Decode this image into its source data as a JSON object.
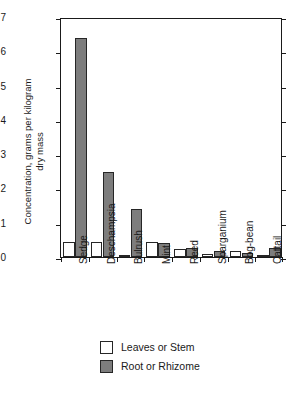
{
  "chart_data": {
    "type": "bar",
    "title": "",
    "xlabel": "",
    "ylabel": "Concentration, grams per kilogram\ndry mass",
    "ylim": [
      0,
      7
    ],
    "yticks": [
      0,
      1,
      2,
      3,
      4,
      5,
      6,
      7
    ],
    "ytick_labels": [
      "0",
      "1",
      "2",
      "3",
      "4",
      "5",
      "6",
      "7"
    ],
    "grid": false,
    "legend_position": "bottom-left",
    "categories": [
      "Sedge",
      "Deschampsia",
      "Bulrush",
      "Mint",
      "Reed",
      "Sparganium",
      "Bog-bean",
      "Cattail"
    ],
    "series": [
      {
        "name": "Leaves or Stem",
        "color": "#ffffff",
        "values": [
          0.45,
          0.45,
          0.07,
          0.45,
          0.22,
          0.1,
          0.17,
          0.06
        ]
      },
      {
        "name": "Root or Rhizome",
        "color": "#7d7d7d",
        "values": [
          6.4,
          2.47,
          1.4,
          0.4,
          0.25,
          0.18,
          0.12,
          0.25
        ]
      }
    ]
  },
  "legend": {
    "items": [
      {
        "label": "Leaves or Stem",
        "swatch": "white"
      },
      {
        "label": "Root or Rhizome",
        "swatch": "gray"
      }
    ]
  }
}
